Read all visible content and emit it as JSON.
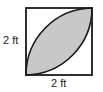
{
  "figure": {
    "type": "geometry",
    "side_label": "2 ft",
    "bottom_label": "2 ft",
    "colors": {
      "stroke": "#1a1a1a",
      "shaded": "#c8c8c8",
      "background": "#ffffff"
    }
  }
}
